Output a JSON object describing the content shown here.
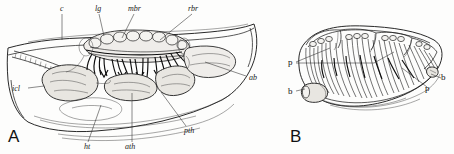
{
  "figure": {
    "background": "#fdfdfc",
    "ink": "#1a1a1a",
    "panels": [
      {
        "letter": "A",
        "name": "lateral-dissection-view",
        "labels": [
          {
            "key": "c",
            "text": "c",
            "x": 60,
            "y": 11,
            "leader": [
              [
                62,
                14
              ],
              [
                62,
                40
              ]
            ]
          },
          {
            "key": "lg",
            "text": "lg",
            "x": 96,
            "y": 11,
            "leader": [
              [
                99,
                14
              ],
              [
                104,
                36
              ]
            ]
          },
          {
            "key": "mbr",
            "text": "mbr",
            "x": 131,
            "y": 11,
            "leader": [
              [
                134,
                14
              ],
              [
                122,
                38
              ]
            ]
          },
          {
            "key": "rbr",
            "text": "rbr",
            "x": 191,
            "y": 11,
            "leader": [
              [
                192,
                14
              ],
              [
                160,
                40
              ]
            ]
          },
          {
            "key": "ab",
            "text": "ab",
            "x": 248,
            "y": 79,
            "leader": [
              [
                246,
                76
              ],
              [
                205,
                62
              ]
            ]
          },
          {
            "key": "icl",
            "text": "icl",
            "x": 14,
            "y": 90,
            "leader": [
              [
                28,
                88
              ],
              [
                44,
                86
              ]
            ]
          },
          {
            "key": "ht",
            "text": "ht",
            "x": 85,
            "y": 148,
            "leader": [
              [
                88,
                142
              ],
              [
                101,
                105
              ]
            ]
          },
          {
            "key": "ath",
            "text": "ath",
            "x": 126,
            "y": 148,
            "leader": [
              [
                132,
                142
              ],
              [
                132,
                93
              ]
            ]
          },
          {
            "key": "pth",
            "text": "pth",
            "x": 186,
            "y": 132,
            "leader": [
              [
                186,
                126
              ],
              [
                161,
                92
              ]
            ]
          }
        ]
      },
      {
        "letter": "B",
        "name": "branchial-basket-view",
        "labels": [
          {
            "key": "p-left",
            "text": "p",
            "x": 290,
            "y": 64,
            "leader": [
              [
                296,
                62
              ],
              [
                330,
                48
              ]
            ]
          },
          {
            "key": "p-left2",
            "text": "",
            "x": 0,
            "y": 0,
            "leader": [
              [
                296,
                63
              ],
              [
                374,
                63
              ]
            ]
          },
          {
            "key": "b-left",
            "text": "b",
            "x": 290,
            "y": 93,
            "leader": [
              [
                296,
                91
              ],
              [
                306,
                89
              ]
            ]
          },
          {
            "key": "p-right",
            "text": "p",
            "x": 428,
            "y": 90,
            "leader": [
              [
                427,
                87
              ],
              [
                400,
                68
              ]
            ]
          },
          {
            "key": "b-right",
            "text": "b",
            "x": 443,
            "y": 81,
            "leader": [
              [
                441,
                78
              ],
              [
                430,
                74
              ]
            ]
          }
        ]
      }
    ]
  }
}
